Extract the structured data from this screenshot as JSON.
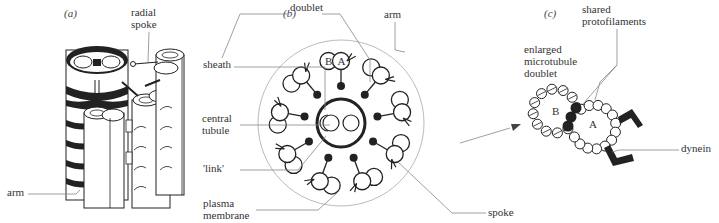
{
  "figure": {
    "panels": [
      {
        "id": "a",
        "label": "(a)"
      },
      {
        "id": "b",
        "label": "(b)"
      },
      {
        "id": "c",
        "label": "(c)"
      }
    ],
    "labels": {
      "radial_spoke_1": "radial",
      "radial_spoke_2": "spoke",
      "doublet": "doublet",
      "arm_a": "arm",
      "arm_b": "arm",
      "sheath": "sheath",
      "central_tubule_1": "central",
      "central_tubule_2": "tubule",
      "link": "'link'",
      "plasma_membrane_1": "plasma",
      "plasma_membrane_2": "membrane",
      "spoke": "spoke",
      "tubule_B": "B",
      "tubule_A": "A",
      "enlarged_1": "enlarged",
      "enlarged_2": "microtubule",
      "enlarged_3": "doublet",
      "shared_1": "shared",
      "shared_2": "protofilaments",
      "c_B": "B",
      "c_A": "A",
      "dynein": "dynein"
    },
    "colors": {
      "ink": "#222222",
      "leader": "#888888",
      "membrane": "#aaaaaa"
    }
  }
}
